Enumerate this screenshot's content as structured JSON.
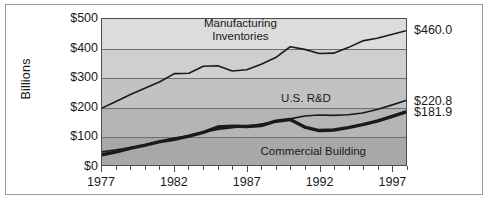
{
  "chart_data": {
    "type": "line",
    "title": "",
    "subtitle": "",
    "xlabel": "",
    "ylabel": "Billions",
    "grid": true,
    "legend_position": "inline-labels",
    "xlim": [
      1977,
      1998
    ],
    "ylim": [
      0,
      500
    ],
    "y_ticks": [
      "$0",
      "$100",
      "$200",
      "$300",
      "$400",
      "$500"
    ],
    "y_tick_values": [
      0,
      100,
      200,
      300,
      400,
      500
    ],
    "x_ticks": [
      "1977",
      "1982",
      "1987",
      "1992",
      "1997"
    ],
    "x_tick_values": [
      1977,
      1982,
      1987,
      1992,
      1997
    ],
    "x_minor_tick_interval": 1,
    "x": [
      1977,
      1978,
      1979,
      1980,
      1981,
      1982,
      1983,
      1984,
      1985,
      1986,
      1987,
      1988,
      1989,
      1990,
      1991,
      1992,
      1993,
      1994,
      1995,
      1996,
      1997,
      1998
    ],
    "series": [
      {
        "name": "Manufacturing Inventories",
        "label": "Manufacturing\nInventories",
        "color": "#1a1a1a",
        "width": 1.6,
        "end_value": 460.0,
        "end_label": "$460.0",
        "values": [
          195,
          218,
          242,
          264,
          285,
          313,
          314,
          338,
          340,
          322,
          326,
          345,
          368,
          405,
          396,
          382,
          383,
          402,
          425,
          434,
          447,
          460
        ]
      },
      {
        "name": "U.S. R&D",
        "label": "U.S. R&D",
        "color": "#1a1a1a",
        "width": 1.6,
        "end_value": 220.8,
        "end_label": "$220.8",
        "values": [
          45,
          52,
          60,
          68,
          80,
          92,
          100,
          112,
          122,
          128,
          133,
          140,
          148,
          158,
          168,
          171,
          170,
          172,
          178,
          190,
          205,
          220.8
        ]
      },
      {
        "name": "Commercial Building",
        "label": "Commercial Building",
        "color": "#1a1a1a",
        "width": 3.4,
        "end_value": 181.9,
        "end_label": "$181.9",
        "values": [
          35,
          45,
          58,
          68,
          80,
          88,
          99,
          112,
          130,
          133,
          132,
          135,
          150,
          156,
          130,
          118,
          120,
          128,
          138,
          150,
          166,
          181.9
        ]
      }
    ],
    "annotations": [
      {
        "text": "Manufacturing Inventories",
        "x": 1986.5,
        "y": 465
      },
      {
        "text": "U.S. R&D",
        "x": 1991.0,
        "y": 232
      },
      {
        "text": "Commercial Building",
        "x": 1991.5,
        "y": 55
      }
    ]
  },
  "axis": {
    "y_title": "Billions"
  },
  "labels": {
    "manufacturing_line1": "Manufacturing",
    "manufacturing_line2": "Inventories",
    "us_rd": "U.S. R&D",
    "commercial_building": "Commercial Building"
  },
  "end_values": {
    "manufacturing": "$460.0",
    "us_rd": "$220.8",
    "commercial_building": "$181.9"
  },
  "y_tick_labels": {
    "t0": "$0",
    "t100": "$100",
    "t200": "$200",
    "t300": "$300",
    "t400": "$400",
    "t500": "$500"
  },
  "x_tick_labels": {
    "t1977": "1977",
    "t1982": "1982",
    "t1987": "1987",
    "t1992": "1992",
    "t1997": "1997"
  },
  "colors": {
    "line": "#1a1a1a",
    "gridline": "#6e6e6e",
    "plot_border": "#4d4d4d",
    "frame": "#9a9a9a",
    "band_top": "#dcdcdc",
    "band_bottom": "#a8a8a8"
  }
}
